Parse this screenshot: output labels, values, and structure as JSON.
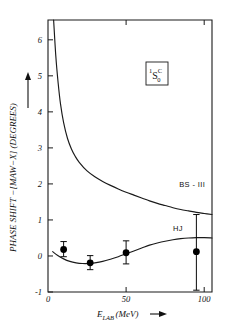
{
  "chart_data": {
    "type": "line",
    "title": "",
    "xlabel": "E_LAB (MeV)",
    "ylabel": "PHASE SHIFT − [MAW−X] (DEGREES)",
    "xlim": [
      0,
      105
    ],
    "ylim": [
      -1,
      6.55
    ],
    "grid": false,
    "legend_position": "inline-curve-labels",
    "xticks": [
      {
        "value": 0,
        "label": "0"
      },
      {
        "value": 50,
        "label": "50"
      },
      {
        "value": 100,
        "label": "100"
      }
    ],
    "yticks": [
      {
        "value": -1,
        "label": "-1"
      },
      {
        "value": 0,
        "label": "0"
      },
      {
        "value": 1,
        "label": "1"
      },
      {
        "value": 2,
        "label": "2"
      },
      {
        "value": 3,
        "label": "3"
      },
      {
        "value": 4,
        "label": "4"
      },
      {
        "value": 5,
        "label": "5"
      },
      {
        "value": 6,
        "label": "6"
      }
    ],
    "annotations": [
      {
        "name": "state-label",
        "text": "1S0C",
        "x": 62,
        "y": 4.9,
        "boxed": true
      }
    ],
    "series": [
      {
        "name": "BS - III",
        "label": "BS - III",
        "type": "line",
        "color": "#1a1a1a",
        "label_x": 84,
        "label_y": 1.92,
        "points": [
          {
            "x": 3.6,
            "y": 6.55
          },
          {
            "x": 5.0,
            "y": 5.55
          },
          {
            "x": 6.5,
            "y": 4.8
          },
          {
            "x": 8.0,
            "y": 4.22
          },
          {
            "x": 10.0,
            "y": 3.7
          },
          {
            "x": 12.5,
            "y": 3.26
          },
          {
            "x": 15.0,
            "y": 2.97
          },
          {
            "x": 17.5,
            "y": 2.76
          },
          {
            "x": 20.0,
            "y": 2.6
          },
          {
            "x": 25.0,
            "y": 2.36
          },
          {
            "x": 30.0,
            "y": 2.2
          },
          {
            "x": 35.0,
            "y": 2.07
          },
          {
            "x": 40.0,
            "y": 1.96
          },
          {
            "x": 45.0,
            "y": 1.86
          },
          {
            "x": 50.0,
            "y": 1.77
          },
          {
            "x": 55.0,
            "y": 1.69
          },
          {
            "x": 60.0,
            "y": 1.61
          },
          {
            "x": 65.0,
            "y": 1.53
          },
          {
            "x": 70.0,
            "y": 1.46
          },
          {
            "x": 75.0,
            "y": 1.4
          },
          {
            "x": 80.0,
            "y": 1.34
          },
          {
            "x": 85.0,
            "y": 1.29
          },
          {
            "x": 90.0,
            "y": 1.25
          },
          {
            "x": 95.0,
            "y": 1.21
          },
          {
            "x": 100.0,
            "y": 1.18
          },
          {
            "x": 105.0,
            "y": 1.15
          }
        ]
      },
      {
        "name": "HJ",
        "label": "HJ",
        "type": "line",
        "color": "#1a1a1a",
        "label_x": 80,
        "label_y": 0.7,
        "points": [
          {
            "x": 3.0,
            "y": 0.12
          },
          {
            "x": 6.0,
            "y": 0.02
          },
          {
            "x": 10.0,
            "y": -0.08
          },
          {
            "x": 14.0,
            "y": -0.15
          },
          {
            "x": 18.0,
            "y": -0.19
          },
          {
            "x": 22.0,
            "y": -0.21
          },
          {
            "x": 26.0,
            "y": -0.21
          },
          {
            "x": 30.0,
            "y": -0.19
          },
          {
            "x": 35.0,
            "y": -0.15
          },
          {
            "x": 40.0,
            "y": -0.09
          },
          {
            "x": 45.0,
            "y": -0.02
          },
          {
            "x": 50.0,
            "y": 0.06
          },
          {
            "x": 55.0,
            "y": 0.14
          },
          {
            "x": 60.0,
            "y": 0.22
          },
          {
            "x": 65.0,
            "y": 0.3
          },
          {
            "x": 70.0,
            "y": 0.36
          },
          {
            "x": 75.0,
            "y": 0.41
          },
          {
            "x": 80.0,
            "y": 0.45
          },
          {
            "x": 85.0,
            "y": 0.48
          },
          {
            "x": 90.0,
            "y": 0.5
          },
          {
            "x": 95.0,
            "y": 0.51
          },
          {
            "x": 100.0,
            "y": 0.51
          },
          {
            "x": 105.0,
            "y": 0.5
          }
        ]
      }
    ],
    "data_points": [
      {
        "x": 10.0,
        "y": 0.18,
        "yerr_low": -0.02,
        "yerr_high": 0.4
      },
      {
        "x": 27.0,
        "y": -0.19,
        "yerr_low": -0.38,
        "yerr_high": 0.01
      },
      {
        "x": 50.0,
        "y": 0.09,
        "yerr_low": -0.22,
        "yerr_high": 0.42
      },
      {
        "x": 95.0,
        "y": 0.12,
        "yerr_low": -0.95,
        "yerr_high": 1.15
      }
    ]
  },
  "labels": {
    "ylabel_text": "PHASE SHIFT −[MAW−X] (DEGREES)",
    "xlabel_e": "E",
    "xlabel_sub": "LAB",
    "xlabel_unit": "(MeV)",
    "arrow": "⟶",
    "state_sup": "1",
    "state_letter": "S",
    "state_sup2": "C",
    "state_sub": "0",
    "curve1": "BS - III",
    "curve2": "HJ",
    "ytick_m1": "-1",
    "ytick_0": "0",
    "ytick_1": "1",
    "ytick_2": "2",
    "ytick_3": "3",
    "ytick_4": "4",
    "ytick_5": "5",
    "ytick_6": "6",
    "xtick_0": "0",
    "xtick_50": "50",
    "xtick_100": "100"
  }
}
